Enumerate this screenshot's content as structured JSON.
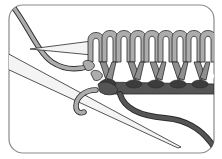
{
  "illustration": {
    "subject": "knitting stitches on needles",
    "elements": [
      "frame",
      "left-needle",
      "right-needle",
      "light-yarn-stitches",
      "dark-yarn-row",
      "working-yarn-light",
      "working-yarn-dark"
    ],
    "stitch_count_top_row": 9
  },
  "colors": {
    "background": "#ffffff",
    "frame": "#8a8a8a",
    "needle_fill": "#f4f4f4",
    "outline": "#2a2a2a",
    "light_yarn": "#acacac",
    "light_yarn_shade": "#8f8f8f",
    "dark_yarn": "#555555",
    "dark_yarn_shade": "#3c3c3c"
  }
}
